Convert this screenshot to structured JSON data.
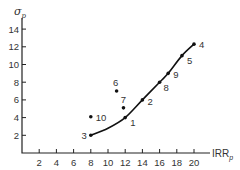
{
  "chart_data": {
    "type": "scatter",
    "title": "",
    "xlabel": "IRR_p",
    "ylabel": "σ_p",
    "xlim": [
      0,
      21
    ],
    "ylim": [
      0,
      15
    ],
    "x_ticks": [
      2,
      4,
      6,
      8,
      10,
      12,
      14,
      16,
      18,
      20
    ],
    "y_ticks": [
      2,
      4,
      6,
      8,
      10,
      12,
      14
    ],
    "grid": false,
    "legend": null,
    "points": [
      {
        "label": "1",
        "x": 12,
        "y": 4.0,
        "on_frontier": true
      },
      {
        "label": "2",
        "x": 14,
        "y": 6.0,
        "on_frontier": true
      },
      {
        "label": "3",
        "x": 8,
        "y": 2.0,
        "on_frontier": true
      },
      {
        "label": "4",
        "x": 20,
        "y": 12.3,
        "on_frontier": true
      },
      {
        "label": "5",
        "x": 18.6,
        "y": 11.0,
        "on_frontier": true
      },
      {
        "label": "6",
        "x": 11,
        "y": 7.0,
        "on_frontier": false
      },
      {
        "label": "7",
        "x": 11.8,
        "y": 5.1,
        "on_frontier": false
      },
      {
        "label": "8",
        "x": 16,
        "y": 8.0,
        "on_frontier": true
      },
      {
        "label": "9",
        "x": 17,
        "y": 9.0,
        "on_frontier": true
      },
      {
        "label": "10",
        "x": 8,
        "y": 4.1,
        "on_frontier": false
      }
    ],
    "frontier_curve": {
      "description": "Efficient frontier curve through points 3, 1, 2, 8, 9, 5, 4",
      "x": [
        8,
        10,
        12,
        14,
        16,
        17,
        18.6,
        20
      ],
      "y": [
        2.0,
        2.8,
        4.0,
        6.0,
        8.0,
        9.0,
        11.0,
        12.3
      ]
    }
  },
  "labels": {
    "y_axis": "σ",
    "y_axis_sub": "p",
    "x_axis": "IRR",
    "x_axis_sub": "p"
  }
}
